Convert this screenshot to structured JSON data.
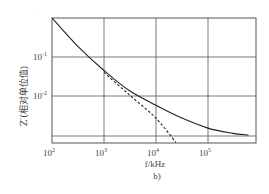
{
  "chart_data": {
    "type": "line",
    "title": "",
    "subfigure_label": "b)",
    "xlabel": "f/kHz",
    "ylabel": "Z′(相对单位值)",
    "xscale": "log",
    "yscale": "log",
    "xlim": [
      100,
      800000
    ],
    "ylim": [
      0.00065,
      1
    ],
    "grid": true,
    "x_ticks": [
      {
        "base": "10",
        "exp": "2",
        "value": 100
      },
      {
        "base": "10",
        "exp": "3",
        "value": 1000
      },
      {
        "base": "10",
        "exp": "4",
        "value": 10000
      },
      {
        "base": "10",
        "exp": "5",
        "value": 100000
      }
    ],
    "y_ticks": [
      {
        "base": "10",
        "exp": "-1",
        "value": 0.1
      },
      {
        "base": "10",
        "exp": "-2",
        "value": 0.01
      }
    ],
    "reference_line_y": 0.001,
    "series": [
      {
        "name": "solid",
        "style": "solid",
        "x": [
          100,
          300,
          1000,
          3000,
          10000,
          30000,
          100000,
          300000,
          600000
        ],
        "y": [
          1.0,
          0.2,
          0.045,
          0.014,
          0.0058,
          0.0028,
          0.0015,
          0.0011,
          0.001
        ]
      },
      {
        "name": "dashed",
        "style": "dashed",
        "x": [
          1000,
          3000,
          10000,
          24000
        ],
        "y": [
          0.04,
          0.011,
          0.0027,
          0.00065
        ]
      }
    ]
  }
}
